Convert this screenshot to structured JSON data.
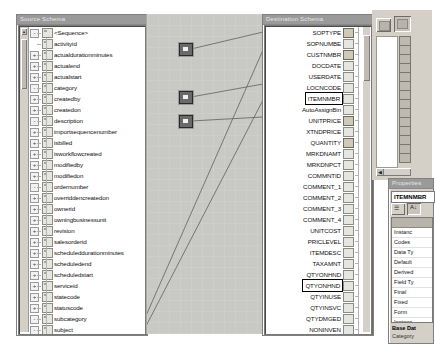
{
  "source_panel": {
    "title": "Source Schema",
    "root": "<Sequence>",
    "items": [
      {
        "label": "activityid",
        "expander": ""
      },
      {
        "label": "actualdurationminutes",
        "expander": "+"
      },
      {
        "label": "actualend",
        "expander": "+"
      },
      {
        "label": "actualstart",
        "expander": "+"
      },
      {
        "label": "category",
        "expander": "-"
      },
      {
        "label": "createdby",
        "expander": "+"
      },
      {
        "label": "createdon",
        "expander": "+"
      },
      {
        "label": "description",
        "expander": "-"
      },
      {
        "label": "importsequencenumber",
        "expander": "+"
      },
      {
        "label": "isbilled",
        "expander": "+"
      },
      {
        "label": "isworkflowcreated",
        "expander": "+"
      },
      {
        "label": "modifiedby",
        "expander": "+"
      },
      {
        "label": "modifiedon",
        "expander": "+"
      },
      {
        "label": "ordernumber",
        "expander": "-"
      },
      {
        "label": "overriddencreatedon",
        "expander": "+"
      },
      {
        "label": "ownerid",
        "expander": "+"
      },
      {
        "label": "owningbusinessunit",
        "expander": "+"
      },
      {
        "label": "revision",
        "expander": "+"
      },
      {
        "label": "salesorderid",
        "expander": "+"
      },
      {
        "label": "scheduleddurationminutes",
        "expander": "+"
      },
      {
        "label": "scheduledend",
        "expander": "+"
      },
      {
        "label": "scheduledstart",
        "expander": "+"
      },
      {
        "label": "serviceid",
        "expander": "+"
      },
      {
        "label": "statecode",
        "expander": "+"
      },
      {
        "label": "statuscode",
        "expander": "+"
      },
      {
        "label": "subcategory",
        "expander": "-"
      },
      {
        "label": "subject",
        "expander": "-"
      },
      {
        "label": "timezoneruleversionnumber",
        "expander": "+"
      },
      {
        "label": "utcconversiontimezonecode",
        "expander": "+"
      },
      {
        "label": "Account",
        "expander": "",
        "linked": true
      },
      {
        "label": "Amount",
        "expander": "",
        "linked": true,
        "selected": true
      }
    ],
    "scroll_up_glyph": "▲"
  },
  "destination_panel": {
    "title": "Destination Schema",
    "items": [
      {
        "label": "SOPTYPE",
        "linked": true
      },
      {
        "label": "SOPNUMBE"
      },
      {
        "label": "CUSTNMBR",
        "linked": true
      },
      {
        "label": "DOCDATE"
      },
      {
        "label": "USERDATE"
      },
      {
        "label": "LOCNCODE"
      },
      {
        "label": "ITEMNMBR",
        "selected": true
      },
      {
        "label": "AutoAssignBin"
      },
      {
        "label": "UNITPRICE",
        "linked": true
      },
      {
        "label": "XTNDPRICE"
      },
      {
        "label": "QUANTITY",
        "linked": true
      },
      {
        "label": "MRKDNAMT"
      },
      {
        "label": "MRKDNPCT"
      },
      {
        "label": "COMMNTID"
      },
      {
        "label": "COMMENT_1"
      },
      {
        "label": "COMMENT_2"
      },
      {
        "label": "COMMENT_3"
      },
      {
        "label": "COMMENT_4"
      },
      {
        "label": "UNITCOST"
      },
      {
        "label": "PRICLEVEL"
      },
      {
        "label": "ITEMDESC"
      },
      {
        "label": "TAXAMNT"
      },
      {
        "label": "QTYONHND"
      },
      {
        "label": "QTYONHND",
        "selected": true
      },
      {
        "label": "QTYINUSE"
      },
      {
        "label": "QTYINSVC"
      },
      {
        "label": "QTYDMGED"
      },
      {
        "label": "NONINVEN"
      },
      {
        "label": "LNITMSEQ"
      },
      {
        "label": "DROPSHIP"
      },
      {
        "label": "QTYTBAOR"
      },
      {
        "label": "DOCID"
      }
    ]
  },
  "canvas": {
    "functoids": [
      {
        "name": "functoid-node-1"
      },
      {
        "name": "functoid-node-2"
      },
      {
        "name": "functoid-node-3"
      }
    ]
  },
  "toolbar": {
    "buttons": [
      {
        "name": "toolbox-button",
        "glyph": ""
      },
      {
        "name": "properties-button",
        "glyph": ""
      }
    ]
  },
  "properties_panel": {
    "title": "Properties",
    "selected_object": "ITEMNMBR",
    "sort_alpha_label": "A↓",
    "sort_category_label": "☰",
    "rows": [
      {
        "label": "Instanc"
      },
      {
        "label": "Codes"
      },
      {
        "label": "Data Ty"
      },
      {
        "label": "Default"
      },
      {
        "label": "Derived"
      },
      {
        "label": "Field Ty"
      },
      {
        "label": "Final"
      },
      {
        "label": "Fixed"
      },
      {
        "label": "Form"
      },
      {
        "label": "Instanc"
      },
      {
        "label": "Nillable"
      }
    ],
    "footer_title": "Base Dat",
    "footer_sub": "Category"
  }
}
